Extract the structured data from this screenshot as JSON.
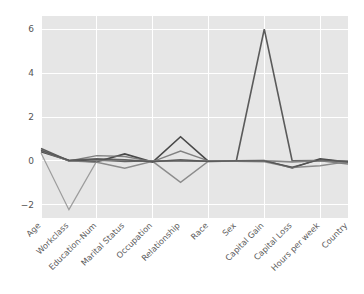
{
  "figure": {
    "width": 364,
    "height": 294,
    "background_color": "#ffffff",
    "axes_background_color": "#e6e6e6",
    "gridline_color": "#ffffff",
    "plot_left": 41,
    "plot_top": 16,
    "plot_right": 348,
    "plot_bottom": 218
  },
  "chart_data": {
    "type": "line",
    "title": "",
    "subtitle": "",
    "xlabel": "",
    "ylabel": "",
    "grid": true,
    "legend_position": "none",
    "categories": [
      "Age",
      "Workclass",
      "Education-Num",
      "Marital Status",
      "Occupation",
      "Relationship",
      "Race",
      "Sex",
      "Capital Gain",
      "Capital Loss",
      "Hours per week",
      "Country"
    ],
    "ytick_labels": [
      "6",
      "4",
      "2",
      "0",
      "−2"
    ],
    "ytick_values": [
      6,
      4,
      2,
      0,
      -2
    ],
    "ylim": [
      -2.6,
      6.6
    ],
    "xlim": [
      0,
      11
    ],
    "series": [
      {
        "name": "series-1",
        "color": "#3f3f3f",
        "width": 1.6,
        "opacity": 0.95,
        "values": [
          0.42,
          0.02,
          -0.04,
          0.32,
          -0.05,
          1.1,
          -0.02,
          0.0,
          0.02,
          -0.32,
          0.1,
          -0.05
        ]
      },
      {
        "name": "series-2",
        "color": "#4a4a4a",
        "width": 1.6,
        "opacity": 0.9,
        "values": [
          0.57,
          0.01,
          0.06,
          -0.02,
          0.01,
          0.0,
          -0.01,
          0.01,
          6.0,
          0.0,
          0.02,
          -0.02
        ]
      },
      {
        "name": "series-3",
        "color": "#6e6e6e",
        "width": 1.4,
        "opacity": 0.85,
        "values": [
          0.5,
          0.0,
          0.24,
          0.2,
          -0.03,
          0.45,
          0.0,
          0.0,
          0.0,
          -0.05,
          0.0,
          -0.14
        ]
      },
      {
        "name": "series-4",
        "color": "#7b7b7b",
        "width": 1.4,
        "opacity": 0.85,
        "values": [
          0.46,
          0.0,
          -0.06,
          -0.33,
          -0.02,
          -0.98,
          -0.01,
          -0.02,
          -0.04,
          -0.3,
          -0.22,
          -0.03
        ]
      },
      {
        "name": "series-5",
        "color": "#8a8a8a",
        "width": 1.2,
        "opacity": 0.8,
        "values": [
          0.36,
          -2.22,
          0.0,
          0.02,
          0.0,
          0.02,
          0.0,
          0.0,
          0.01,
          -0.02,
          0.01,
          0.0
        ]
      },
      {
        "name": "series-6",
        "color": "#555555",
        "width": 1.4,
        "opacity": 0.9,
        "values": [
          0.48,
          0.03,
          0.1,
          0.05,
          -0.04,
          0.05,
          -0.02,
          0.0,
          0.0,
          -0.28,
          0.06,
          -0.04
        ]
      }
    ]
  }
}
